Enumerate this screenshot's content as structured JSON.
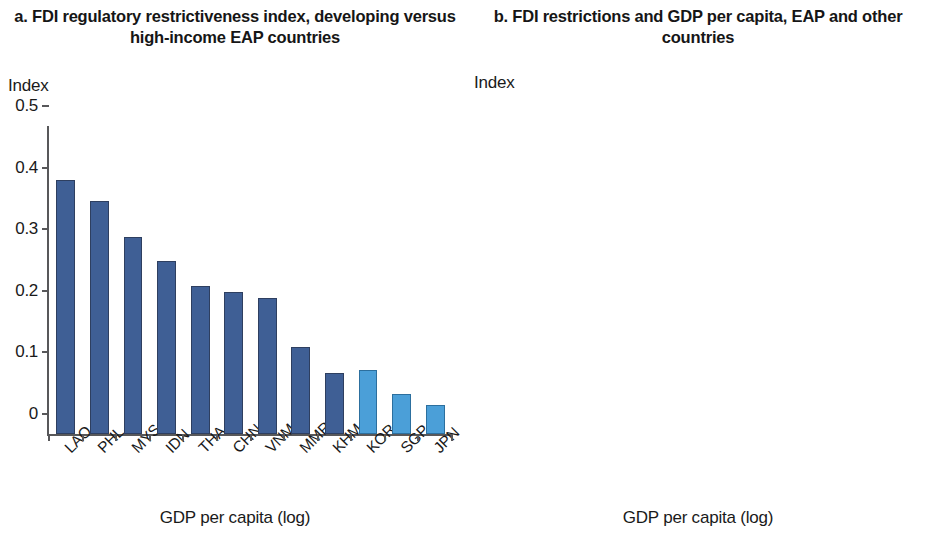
{
  "panel_a": {
    "title": "a. FDI regulatory restrictiveness index, developing versus high-income EAP countries",
    "axis_unit": "Index",
    "xlabel": "GDP per capita (log)"
  },
  "panel_b": {
    "title": "b. FDI restrictions and GDP per capita, EAP and other countries",
    "axis_unit": "Index",
    "xlabel": "GDP per capita (log)"
  },
  "colors": {
    "developing": "#3f5f95",
    "high_income": "#4b9fd8",
    "other_countries": "#63b0e0",
    "trendline": "#c8793f",
    "axis": "#58585a"
  },
  "chart_data": [
    {
      "type": "bar",
      "panel": "a",
      "title": "a. FDI regulatory restrictiveness index, developing versus high-income EAP countries",
      "xlabel": "GDP per capita (log)",
      "ylabel": "Index",
      "ylim": [
        0,
        0.5
      ],
      "yticks": [
        "0",
        "0.1",
        "0.2",
        "0.3",
        "0.4",
        "0.5"
      ],
      "ytick_values": [
        0,
        0.1,
        0.2,
        0.3,
        0.4,
        0.5
      ],
      "grid": false,
      "legend": "none",
      "categories": [
        "LAO",
        "PHL",
        "MYS",
        "IDN",
        "THA",
        "CHN",
        "VNM",
        "MMR",
        "KHM",
        "KOR",
        "SGP",
        "JPN"
      ],
      "values": [
        0.413,
        0.379,
        0.32,
        0.281,
        0.241,
        0.231,
        0.22,
        0.142,
        0.099,
        0.104,
        0.065,
        0.047
      ],
      "group": [
        "developing",
        "developing",
        "developing",
        "developing",
        "developing",
        "developing",
        "developing",
        "developing",
        "developing",
        "high_income",
        "high_income",
        "high_income"
      ]
    },
    {
      "type": "scatter",
      "panel": "b",
      "title": "b. FDI restrictions and GDP per capita, EAP and other countries",
      "xlabel": "GDP per capita (log)",
      "ylabel": "Index",
      "xlim": [
        7,
        12
      ],
      "ylim": [
        0,
        0.6
      ],
      "xticks": [
        "7",
        "8",
        "9",
        "10",
        "11",
        "12"
      ],
      "xtick_values": [
        7,
        8,
        9,
        10,
        11,
        12
      ],
      "yticks": [
        "0",
        "0.1",
        "0.2",
        "0.3",
        "0.4",
        "0.5",
        "0.6"
      ],
      "ytick_values": [
        0,
        0.1,
        0.2,
        0.3,
        0.4,
        0.5,
        0.6
      ],
      "grid": false,
      "legend": "none",
      "trendline": {
        "x": [
          7.0,
          11.72
        ],
        "y": [
          0.222,
          0.047
        ],
        "style": "dashed"
      },
      "labeled_points": [
        {
          "label": "LAO",
          "x": 8.96,
          "y": 0.414,
          "label_dx": 0.22,
          "label_dy": 0.015
        },
        {
          "label": "PHL",
          "x": 8.99,
          "y": 0.382,
          "label_dx": -0.45,
          "label_dy": 0.005
        },
        {
          "label": "IDN",
          "x": 9.3,
          "y": 0.288,
          "label_dx": 0.2,
          "label_dy": 0.03
        },
        {
          "label": "MYS",
          "x": 10.05,
          "y": 0.317,
          "label_dx": -0.03,
          "label_dy": 0.038
        },
        {
          "label": "VNM",
          "x": 9.18,
          "y": 0.213,
          "label_dx": -0.43,
          "label_dy": 0.01
        },
        {
          "label": "THA",
          "x": 9.77,
          "y": 0.225,
          "label_dx": 0.35,
          "label_dy": 0.012
        },
        {
          "label": "CHN",
          "x": 9.66,
          "y": 0.22,
          "label_dx": 0.07,
          "label_dy": -0.035
        },
        {
          "label": "MMR",
          "x": 8.62,
          "y": 0.147,
          "label_dx": -0.47,
          "label_dy": 0.0
        },
        {
          "label": "KHM",
          "x": 8.52,
          "y": 0.108,
          "label_dx": -0.04,
          "label_dy": -0.035
        }
      ],
      "other_points": [
        {
          "x": 10.05,
          "y": 0.567
        },
        {
          "x": 7.7,
          "y": 0.404
        },
        {
          "x": 7.78,
          "y": 0.322
        },
        {
          "x": 7.22,
          "y": 0.301
        },
        {
          "x": 7.39,
          "y": 0.264
        },
        {
          "x": 9.23,
          "y": 0.341
        },
        {
          "x": 10.36,
          "y": 0.327
        },
        {
          "x": 10.26,
          "y": 0.283
        },
        {
          "x": 9.13,
          "y": 0.272
        },
        {
          "x": 7.33,
          "y": 0.178
        },
        {
          "x": 9.3,
          "y": 0.232
        },
        {
          "x": 8.86,
          "y": 0.218
        },
        {
          "x": 8.77,
          "y": 0.216
        },
        {
          "x": 9.01,
          "y": 0.203
        },
        {
          "x": 7.46,
          "y": 0.192
        },
        {
          "x": 8.57,
          "y": 0.178
        },
        {
          "x": 9.08,
          "y": 0.17
        },
        {
          "x": 8.82,
          "y": 0.159
        },
        {
          "x": 9.2,
          "y": 0.149
        },
        {
          "x": 9.32,
          "y": 0.141
        },
        {
          "x": 9.46,
          "y": 0.136
        },
        {
          "x": 9.56,
          "y": 0.131
        },
        {
          "x": 9.67,
          "y": 0.133
        },
        {
          "x": 9.8,
          "y": 0.136
        },
        {
          "x": 9.95,
          "y": 0.132
        },
        {
          "x": 8.22,
          "y": 0.11
        },
        {
          "x": 8.18,
          "y": 0.104
        },
        {
          "x": 8.66,
          "y": 0.104
        },
        {
          "x": 8.75,
          "y": 0.089
        },
        {
          "x": 8.29,
          "y": 0.058
        },
        {
          "x": 8.93,
          "y": 0.052
        },
        {
          "x": 9.42,
          "y": 0.113
        },
        {
          "x": 9.52,
          "y": 0.101
        },
        {
          "x": 9.63,
          "y": 0.088
        },
        {
          "x": 9.72,
          "y": 0.074
        },
        {
          "x": 9.86,
          "y": 0.071
        },
        {
          "x": 9.96,
          "y": 0.064
        },
        {
          "x": 10.08,
          "y": 0.107
        },
        {
          "x": 10.2,
          "y": 0.113
        },
        {
          "x": 10.47,
          "y": 0.121
        },
        {
          "x": 10.57,
          "y": 0.145
        },
        {
          "x": 10.67,
          "y": 0.146
        },
        {
          "x": 10.76,
          "y": 0.134
        },
        {
          "x": 10.86,
          "y": 0.12
        },
        {
          "x": 10.48,
          "y": 0.162
        },
        {
          "x": 10.66,
          "y": 0.163
        },
        {
          "x": 11.02,
          "y": 0.103
        },
        {
          "x": 10.43,
          "y": 0.104
        },
        {
          "x": 10.58,
          "y": 0.091
        },
        {
          "x": 10.32,
          "y": 0.08
        },
        {
          "x": 10.47,
          "y": 0.075
        },
        {
          "x": 10.7,
          "y": 0.066
        },
        {
          "x": 10.83,
          "y": 0.06
        },
        {
          "x": 11.08,
          "y": 0.057
        },
        {
          "x": 11.19,
          "y": 0.049
        },
        {
          "x": 9.38,
          "y": 0.046
        },
        {
          "x": 9.48,
          "y": 0.041
        },
        {
          "x": 9.58,
          "y": 0.036
        },
        {
          "x": 9.68,
          "y": 0.03
        },
        {
          "x": 9.44,
          "y": 0.021
        },
        {
          "x": 9.54,
          "y": 0.014
        },
        {
          "x": 9.64,
          "y": 0.009
        },
        {
          "x": 9.74,
          "y": 0.005
        },
        {
          "x": 9.86,
          "y": 0.029
        },
        {
          "x": 9.98,
          "y": 0.022
        },
        {
          "x": 10.1,
          "y": 0.018
        },
        {
          "x": 10.22,
          "y": 0.014
        },
        {
          "x": 10.34,
          "y": 0.01
        },
        {
          "x": 10.46,
          "y": 0.007
        },
        {
          "x": 10.58,
          "y": 0.012
        },
        {
          "x": 10.7,
          "y": 0.017
        },
        {
          "x": 10.82,
          "y": 0.013
        },
        {
          "x": 10.94,
          "y": 0.009
        },
        {
          "x": 11.06,
          "y": 0.006
        },
        {
          "x": 11.18,
          "y": 0.004
        },
        {
          "x": 11.42,
          "y": 0.008
        },
        {
          "x": 11.66,
          "y": 0.007
        },
        {
          "x": 9.42,
          "y": 0.061
        },
        {
          "x": 10.06,
          "y": 0.046
        },
        {
          "x": 10.18,
          "y": 0.04
        },
        {
          "x": 10.3,
          "y": 0.048
        },
        {
          "x": 10.92,
          "y": 0.041
        },
        {
          "x": 11.12,
          "y": 0.029
        },
        {
          "x": 8.44,
          "y": 0.143
        },
        {
          "x": 8.38,
          "y": 0.03
        },
        {
          "x": 7.88,
          "y": 0.128
        },
        {
          "x": 7.62,
          "y": 0.112
        }
      ]
    }
  ]
}
